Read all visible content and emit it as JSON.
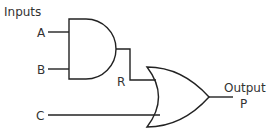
{
  "diagram": {
    "labels": {
      "inputs_heading": "Inputs",
      "input_a": "A",
      "input_b": "B",
      "input_c": "C",
      "intermediate_r": "R",
      "output_heading": "Output",
      "output_p": "P"
    },
    "gates": [
      {
        "type": "AND",
        "inputs": [
          "A",
          "B"
        ],
        "output": "R"
      },
      {
        "type": "OR",
        "inputs": [
          "R",
          "C"
        ],
        "output": "P"
      }
    ],
    "colors": {
      "stroke": "#222222",
      "text": "#333333"
    }
  }
}
